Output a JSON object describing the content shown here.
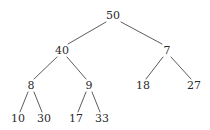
{
  "figure": {
    "width": 210,
    "height": 130,
    "background_color": "#ffffff",
    "text_color": "#2b2b2b",
    "edge_color": "#4a4a4a"
  },
  "tree": {
    "root_value": "50",
    "depth": 4,
    "nodes": [
      {
        "id": "n50",
        "label": "50",
        "x": 113,
        "y": 15,
        "level": 0
      },
      {
        "id": "n40",
        "label": "40",
        "x": 62,
        "y": 50,
        "level": 1
      },
      {
        "id": "n7",
        "label": "7",
        "x": 167,
        "y": 50,
        "level": 1
      },
      {
        "id": "n8",
        "label": "8",
        "x": 31,
        "y": 85,
        "level": 2
      },
      {
        "id": "n9",
        "label": "9",
        "x": 89,
        "y": 85,
        "level": 2
      },
      {
        "id": "n18",
        "label": "18",
        "x": 143,
        "y": 85,
        "level": 2
      },
      {
        "id": "n27",
        "label": "27",
        "x": 194,
        "y": 85,
        "level": 2
      },
      {
        "id": "n10",
        "label": "10",
        "x": 18,
        "y": 118,
        "level": 3
      },
      {
        "id": "n30",
        "label": "30",
        "x": 44,
        "y": 118,
        "level": 3
      },
      {
        "id": "n17",
        "label": "17",
        "x": 76,
        "y": 118,
        "level": 3
      },
      {
        "id": "n33",
        "label": "33",
        "x": 102,
        "y": 118,
        "level": 3
      }
    ],
    "edges": [
      {
        "id": "e50-40",
        "from": "n50",
        "to": "n40",
        "x1": 106,
        "y1": 22,
        "x2": 68,
        "y2": 44
      },
      {
        "id": "e50-7",
        "from": "n50",
        "to": "n7",
        "x1": 121,
        "y1": 22,
        "x2": 162,
        "y2": 44
      },
      {
        "id": "e40-8",
        "from": "n40",
        "to": "n8",
        "x1": 57,
        "y1": 57,
        "x2": 34,
        "y2": 79
      },
      {
        "id": "e40-9",
        "from": "n40",
        "to": "n9",
        "x1": 67,
        "y1": 57,
        "x2": 86,
        "y2": 79
      },
      {
        "id": "e7-18",
        "from": "n7",
        "to": "n18",
        "x1": 163,
        "y1": 57,
        "x2": 146,
        "y2": 79
      },
      {
        "id": "e7-27",
        "from": "n7",
        "to": "n27",
        "x1": 171,
        "y1": 57,
        "x2": 191,
        "y2": 79
      },
      {
        "id": "e8-10",
        "from": "n8",
        "to": "n10",
        "x1": 28,
        "y1": 92,
        "x2": 20,
        "y2": 112
      },
      {
        "id": "e8-30",
        "from": "n8",
        "to": "n30",
        "x1": 34,
        "y1": 92,
        "x2": 42,
        "y2": 112
      },
      {
        "id": "e9-17",
        "from": "n9",
        "to": "n17",
        "x1": 86,
        "y1": 92,
        "x2": 78,
        "y2": 112
      },
      {
        "id": "e9-33",
        "from": "n9",
        "to": "n33",
        "x1": 92,
        "y1": 92,
        "x2": 100,
        "y2": 112
      }
    ]
  }
}
